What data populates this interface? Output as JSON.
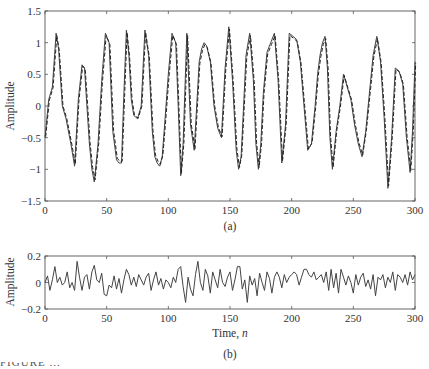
{
  "chart_data": [
    {
      "type": "line",
      "panel_label": "(a)",
      "title": "",
      "xlabel": "",
      "ylabel": "Amplitude",
      "xlim": [
        0,
        300
      ],
      "ylim": [
        -1.5,
        1.5
      ],
      "xticks": [
        0,
        50,
        100,
        150,
        200,
        250,
        300
      ],
      "yticks": [
        -1.5,
        -1,
        -0.5,
        0,
        0.5,
        1,
        1.5
      ],
      "ytick_labels": [
        "-1.5",
        "-1",
        "-0.5",
        "0",
        "0.5",
        "1",
        "1.5"
      ],
      "grid": false,
      "legend": null,
      "series": [
        {
          "name": "solid",
          "style": "solid",
          "x": [
            0,
            3,
            6,
            9,
            11,
            14,
            17,
            21,
            24,
            27,
            30,
            32,
            34,
            36,
            38,
            40,
            43,
            46,
            49,
            52,
            55,
            58,
            60,
            62,
            64,
            66,
            68,
            70,
            72,
            75,
            78,
            81,
            84,
            87,
            89,
            91,
            93,
            95,
            97,
            100,
            103,
            106,
            108,
            110,
            112,
            115,
            118,
            121,
            123,
            125,
            127,
            129,
            131,
            134,
            137,
            140,
            143,
            146,
            149,
            152,
            155,
            157,
            159,
            161,
            163,
            166,
            169,
            171,
            173,
            175,
            177,
            180,
            183,
            186,
            189,
            192,
            195,
            198,
            201,
            204,
            207,
            210,
            213,
            216,
            219,
            221,
            223,
            225,
            227,
            229,
            231,
            233,
            236,
            239,
            242,
            245,
            248,
            251,
            254,
            257,
            260,
            263,
            266,
            269,
            272,
            275,
            278,
            281,
            284,
            287,
            290,
            293,
            296,
            298,
            300
          ],
          "y": [
            -0.5,
            0.1,
            0.3,
            1.15,
            0.9,
            0.0,
            -0.2,
            -0.6,
            -0.95,
            0.1,
            0.65,
            0.6,
            0.0,
            -0.6,
            -1.0,
            -1.2,
            -0.6,
            0.4,
            1.15,
            1.0,
            -0.4,
            -0.85,
            -0.9,
            -0.9,
            0.2,
            1.2,
            0.8,
            0.1,
            -0.15,
            -0.2,
            0.0,
            1.2,
            0.8,
            -0.4,
            -0.8,
            -0.9,
            -0.95,
            -0.8,
            -0.3,
            0.5,
            1.15,
            1.0,
            0.0,
            -1.1,
            -0.6,
            1.15,
            -0.3,
            -0.7,
            0.0,
            0.7,
            0.9,
            1.0,
            0.95,
            0.7,
            0.0,
            -0.35,
            -0.5,
            0.6,
            1.25,
            0.4,
            -0.7,
            -1.0,
            -0.8,
            0.0,
            0.8,
            1.15,
            0.4,
            -0.6,
            -1.0,
            -0.6,
            0.2,
            0.85,
            1.0,
            1.15,
            0.4,
            -0.9,
            -0.3,
            1.15,
            1.1,
            1.05,
            0.7,
            0.0,
            -0.7,
            -0.6,
            0.0,
            0.5,
            0.8,
            1.0,
            1.1,
            0.6,
            -0.5,
            -1.0,
            -0.4,
            0.0,
            0.5,
            0.3,
            0.1,
            -0.3,
            -0.6,
            -0.8,
            -0.4,
            0.2,
            0.8,
            1.1,
            0.7,
            -0.2,
            -1.3,
            -0.5,
            0.6,
            0.55,
            0.35,
            -0.5,
            -1.05,
            -0.4,
            0.7,
            0.8,
            1.05,
            1.0,
            0.5
          ]
        },
        {
          "name": "dashed",
          "style": "dashed",
          "note": "closely overlaps solid series"
        }
      ]
    },
    {
      "type": "line",
      "panel_label": "(b)",
      "title": "",
      "xlabel": "Time, n",
      "ylabel": "Amplitude",
      "xlim": [
        0,
        300
      ],
      "ylim": [
        -0.2,
        0.2
      ],
      "xticks": [
        0,
        50,
        100,
        150,
        200,
        250,
        300
      ],
      "yticks": [
        -0.2,
        0,
        0.2
      ],
      "ytick_labels": [
        "-0.2",
        "0",
        "0.2"
      ],
      "grid": false,
      "legend": null,
      "series": [
        {
          "name": "error",
          "style": "solid",
          "x": [
            0,
            2,
            4,
            6,
            8,
            10,
            12,
            14,
            16,
            18,
            20,
            22,
            24,
            26,
            28,
            30,
            32,
            34,
            36,
            38,
            40,
            42,
            44,
            46,
            48,
            50,
            52,
            54,
            56,
            58,
            60,
            62,
            64,
            66,
            68,
            70,
            72,
            74,
            76,
            78,
            80,
            82,
            84,
            86,
            88,
            90,
            92,
            94,
            96,
            98,
            100,
            102,
            104,
            106,
            108,
            110,
            112,
            114,
            116,
            118,
            120,
            122,
            124,
            126,
            128,
            130,
            132,
            134,
            136,
            138,
            140,
            142,
            144,
            146,
            148,
            150,
            152,
            154,
            156,
            158,
            160,
            162,
            164,
            166,
            168,
            170,
            172,
            174,
            176,
            178,
            180,
            182,
            184,
            186,
            188,
            190,
            192,
            194,
            196,
            198,
            200,
            202,
            204,
            206,
            208,
            210,
            212,
            214,
            216,
            218,
            220,
            222,
            224,
            226,
            228,
            230,
            232,
            234,
            236,
            238,
            240,
            242,
            244,
            246,
            248,
            250,
            252,
            254,
            256,
            258,
            260,
            262,
            264,
            266,
            268,
            270,
            272,
            274,
            276,
            278,
            280,
            282,
            284,
            286,
            288,
            290,
            292,
            294,
            296,
            298,
            300
          ],
          "y": [
            0.0,
            0.05,
            -0.06,
            0.02,
            0.12,
            0.0,
            0.04,
            -0.02,
            0.0,
            0.08,
            -0.04,
            0.0,
            -0.06,
            0.16,
            0.04,
            -0.06,
            0.04,
            0.06,
            -0.05,
            0.08,
            0.13,
            0.02,
            0.0,
            0.07,
            -0.09,
            -0.1,
            -0.02,
            -0.04,
            0.05,
            -0.05,
            0.03,
            -0.08,
            0.02,
            0.1,
            0.06,
            -0.02,
            0.04,
            -0.03,
            0.06,
            0.02,
            -0.02,
            0.04,
            0.07,
            -0.06,
            0.02,
            0.08,
            -0.02,
            0.03,
            -0.05,
            0.02,
            0.0,
            -0.04,
            0.04,
            0.0,
            0.1,
            0.12,
            -0.03,
            -0.15,
            0.04,
            -0.05,
            -0.1,
            0.06,
            0.16,
            0.0,
            -0.06,
            0.1,
            0.05,
            -0.08,
            0.08,
            0.02,
            -0.04,
            0.1,
            0.0,
            -0.03,
            0.04,
            0.08,
            -0.06,
            0.02,
            0.12,
            0.12,
            -0.05,
            0.02,
            -0.15,
            0.05,
            -0.02,
            0.03,
            -0.1,
            0.07,
            0.0,
            -0.06,
            0.08,
            0.03,
            -0.08,
            0.04,
            0.08,
            0.04,
            -0.04,
            0.06,
            0.0,
            0.04,
            0.06,
            0.08,
            0.06,
            -0.02,
            0.04,
            0.1,
            0.1,
            0.06,
            0.04,
            0.08,
            0.02,
            0.04,
            0.06,
            0.0,
            0.08,
            -0.06,
            0.1,
            -0.04,
            0.07,
            -0.08,
            0.1,
            0.04,
            -0.02,
            0.05,
            0.0,
            -0.08,
            0.06,
            -0.02,
            0.04,
            0.07,
            -0.03,
            0.02,
            -0.05,
            0.06,
            -0.1,
            0.04,
            0.02,
            0.06,
            -0.04,
            0.04,
            0.0,
            0.08,
            -0.06,
            0.06,
            0.04,
            0.0,
            0.06,
            -0.02,
            0.08,
            0.02,
            0.06,
            -0.02,
            0.06
          ]
        }
      ]
    }
  ],
  "panels": {
    "top": {
      "ylabel": "Amplitude",
      "panel_label": "(a)",
      "xtick_labels": [
        "0",
        "50",
        "100",
        "150",
        "200",
        "250",
        "300"
      ],
      "ytick_labels": [
        "1.5",
        "1",
        "0.5",
        "0",
        "−0.5",
        "−1",
        "−1.5"
      ]
    },
    "bottom": {
      "ylabel": "Amplitude",
      "xlabel": "Time, n",
      "panel_label": "(b)",
      "xtick_labels": [
        "0",
        "50",
        "100",
        "150",
        "200",
        "250",
        "300"
      ],
      "ytick_labels": [
        "0.2",
        "0",
        "−0.2"
      ]
    }
  },
  "caption_partial": "FIGURE ..."
}
